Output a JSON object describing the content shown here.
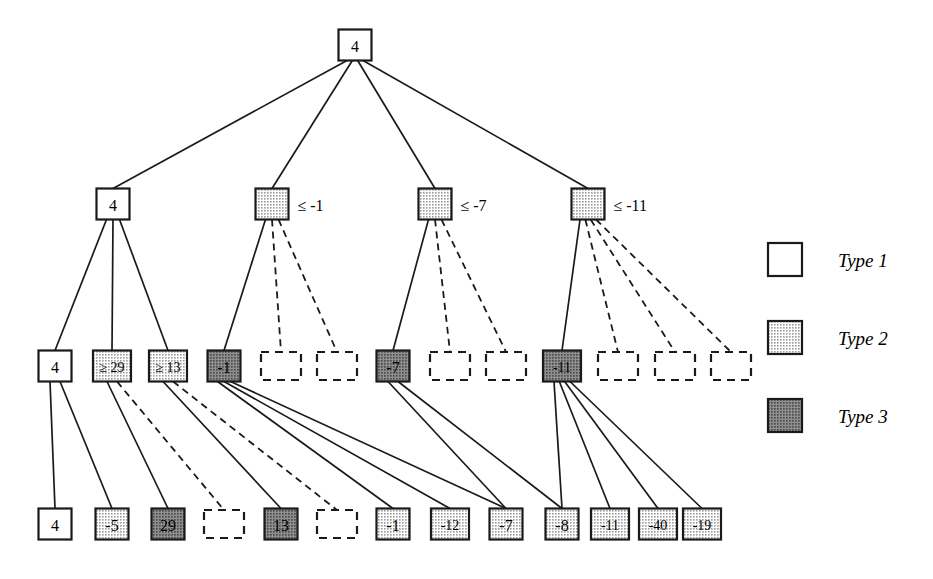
{
  "diagram": {
    "title": "",
    "type": "tree",
    "colors": {
      "type1_fill": "#ffffff",
      "type2_fill": "#d4d4d4",
      "type3_fill": "#8a8a8a",
      "stroke": "#1a1a1a",
      "edge": "#1a1a1a",
      "background": "#ffffff"
    },
    "legend": {
      "items": [
        {
          "label": "Type 1",
          "swatch": "type1"
        },
        {
          "label": "Type 2",
          "swatch": "type2"
        },
        {
          "label": "Type 3",
          "swatch": "type3"
        }
      ]
    },
    "levels": [
      {
        "level": 0,
        "nodes": [
          {
            "id": "n0",
            "text": "4",
            "type": "type1",
            "style": "solid",
            "x": 355,
            "y": 45,
            "side_label": ""
          }
        ]
      },
      {
        "level": 1,
        "nodes": [
          {
            "id": "n1",
            "text": "4",
            "type": "type1",
            "style": "solid",
            "x": 113,
            "y": 204,
            "side_label": ""
          },
          {
            "id": "n2",
            "text": "",
            "type": "type2",
            "style": "solid",
            "x": 272,
            "y": 204,
            "side_label": "≤ -1"
          },
          {
            "id": "n3",
            "text": "",
            "type": "type2",
            "style": "solid",
            "x": 435,
            "y": 204,
            "side_label": "≤ -7"
          },
          {
            "id": "n4",
            "text": "",
            "type": "type2",
            "style": "solid",
            "x": 588,
            "y": 204,
            "side_label": "≤ -11"
          }
        ]
      },
      {
        "level": 2,
        "nodes": [
          {
            "id": "m1",
            "text": "4",
            "type": "type1",
            "style": "solid",
            "x": 55,
            "y": 366,
            "side_label": ""
          },
          {
            "id": "m2",
            "text": "≥ 29",
            "type": "type2",
            "style": "solid",
            "x": 112,
            "y": 366,
            "side_label": ""
          },
          {
            "id": "m3",
            "text": "≥ 13",
            "type": "type2",
            "style": "solid",
            "x": 168,
            "y": 366,
            "side_label": ""
          },
          {
            "id": "m4",
            "text": "-1",
            "type": "type3",
            "style": "solid",
            "x": 224,
            "y": 366,
            "side_label": ""
          },
          {
            "id": "m5",
            "text": "",
            "type": "none",
            "style": "dashed",
            "x": 281,
            "y": 366,
            "side_label": ""
          },
          {
            "id": "m6",
            "text": "",
            "type": "none",
            "style": "dashed",
            "x": 337,
            "y": 366,
            "side_label": ""
          },
          {
            "id": "m7",
            "text": "-7",
            "type": "type3",
            "style": "solid",
            "x": 393,
            "y": 366,
            "side_label": ""
          },
          {
            "id": "m8",
            "text": "",
            "type": "none",
            "style": "dashed",
            "x": 450,
            "y": 366,
            "side_label": ""
          },
          {
            "id": "m9",
            "text": "",
            "type": "none",
            "style": "dashed",
            "x": 506,
            "y": 366,
            "side_label": ""
          },
          {
            "id": "m10",
            "text": "-11",
            "type": "type3",
            "style": "solid",
            "x": 562,
            "y": 366,
            "side_label": ""
          },
          {
            "id": "m11",
            "text": "",
            "type": "none",
            "style": "dashed",
            "x": 618,
            "y": 366,
            "side_label": ""
          },
          {
            "id": "m12",
            "text": "",
            "type": "none",
            "style": "dashed",
            "x": 675,
            "y": 366,
            "side_label": ""
          },
          {
            "id": "m13",
            "text": "",
            "type": "none",
            "style": "dashed",
            "x": 731,
            "y": 366,
            "side_label": ""
          }
        ]
      },
      {
        "level": 3,
        "nodes": [
          {
            "id": "l1",
            "text": "4",
            "type": "type1",
            "style": "solid",
            "x": 55,
            "y": 524,
            "side_label": ""
          },
          {
            "id": "l2",
            "text": "-5",
            "type": "type2",
            "style": "solid",
            "x": 112,
            "y": 524,
            "side_label": ""
          },
          {
            "id": "l3",
            "text": "29",
            "type": "type3",
            "style": "solid",
            "x": 168,
            "y": 524,
            "side_label": ""
          },
          {
            "id": "l4",
            "text": "",
            "type": "none",
            "style": "dashed",
            "x": 224,
            "y": 524,
            "side_label": ""
          },
          {
            "id": "l5",
            "text": "13",
            "type": "type3",
            "style": "solid",
            "x": 281,
            "y": 524,
            "side_label": ""
          },
          {
            "id": "l6",
            "text": "",
            "type": "none",
            "style": "dashed",
            "x": 337,
            "y": 524,
            "side_label": ""
          },
          {
            "id": "l7",
            "text": "-1",
            "type": "type2",
            "style": "solid",
            "x": 393,
            "y": 524,
            "side_label": ""
          },
          {
            "id": "l8",
            "text": "-12",
            "type": "type2",
            "style": "solid",
            "x": 450,
            "y": 524,
            "side_label": ""
          },
          {
            "id": "l9",
            "text": "-7",
            "type": "type2",
            "style": "solid",
            "x": 506,
            "y": 524,
            "side_label": ""
          },
          {
            "id": "l10",
            "text": "-8",
            "type": "type2",
            "style": "solid",
            "x": 562,
            "y": 524,
            "side_label": ""
          },
          {
            "id": "l11",
            "text": "-11",
            "type": "type2",
            "style": "solid",
            "x": 610,
            "y": 524,
            "side_label": ""
          },
          {
            "id": "l12",
            "text": "-40",
            "type": "type2",
            "style": "solid",
            "x": 658,
            "y": 524,
            "side_label": ""
          },
          {
            "id": "l13",
            "text": "-19",
            "type": "type2",
            "style": "solid",
            "x": 702,
            "y": 524,
            "side_label": ""
          }
        ]
      }
    ],
    "edges": [
      {
        "from": "n0",
        "to": "n1",
        "style": "solid"
      },
      {
        "from": "n0",
        "to": "n2",
        "style": "solid"
      },
      {
        "from": "n0",
        "to": "n3",
        "style": "solid"
      },
      {
        "from": "n0",
        "to": "n4",
        "style": "solid"
      },
      {
        "from": "n1",
        "to": "m1",
        "style": "solid"
      },
      {
        "from": "n1",
        "to": "m2",
        "style": "solid"
      },
      {
        "from": "n1",
        "to": "m3",
        "style": "solid"
      },
      {
        "from": "n2",
        "to": "m4",
        "style": "solid"
      },
      {
        "from": "n2",
        "to": "m5",
        "style": "dashed"
      },
      {
        "from": "n2",
        "to": "m6",
        "style": "dashed"
      },
      {
        "from": "n3",
        "to": "m7",
        "style": "solid"
      },
      {
        "from": "n3",
        "to": "m8",
        "style": "dashed"
      },
      {
        "from": "n3",
        "to": "m9",
        "style": "dashed"
      },
      {
        "from": "n4",
        "to": "m10",
        "style": "solid"
      },
      {
        "from": "n4",
        "to": "m11",
        "style": "dashed"
      },
      {
        "from": "n4",
        "to": "m12",
        "style": "dashed"
      },
      {
        "from": "n4",
        "to": "m13",
        "style": "dashed"
      },
      {
        "from": "m1",
        "to": "l1",
        "style": "solid"
      },
      {
        "from": "m1",
        "to": "l2",
        "style": "solid"
      },
      {
        "from": "m2",
        "to": "l3",
        "style": "solid"
      },
      {
        "from": "m2",
        "to": "l4",
        "style": "dashed"
      },
      {
        "from": "m3",
        "to": "l5",
        "style": "solid"
      },
      {
        "from": "m3",
        "to": "l6",
        "style": "dashed"
      },
      {
        "from": "m4",
        "to": "l7",
        "style": "solid"
      },
      {
        "from": "m4",
        "to": "l8",
        "style": "solid"
      },
      {
        "from": "m4",
        "to": "l9",
        "style": "solid"
      },
      {
        "from": "m7",
        "to": "l9",
        "style": "solid"
      },
      {
        "from": "m7",
        "to": "l10",
        "style": "solid"
      },
      {
        "from": "m10",
        "to": "l10",
        "style": "solid"
      },
      {
        "from": "m10",
        "to": "l11",
        "style": "solid"
      },
      {
        "from": "m10",
        "to": "l12",
        "style": "solid"
      },
      {
        "from": "m10",
        "to": "l13",
        "style": "solid"
      }
    ],
    "legend_position": {
      "x": 768,
      "y": 243
    }
  }
}
